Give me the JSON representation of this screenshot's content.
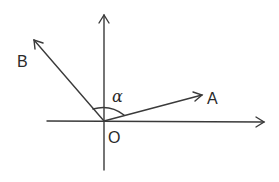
{
  "diagram": {
    "labels": {
      "origin": "O",
      "point_a": "A",
      "point_b": "B",
      "angle": "α"
    },
    "colors": {
      "line": "#3a3a3a",
      "text": "#2a2a2a"
    }
  }
}
